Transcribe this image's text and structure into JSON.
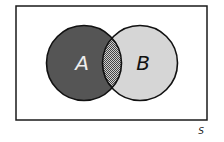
{
  "diagram": {
    "type": "venn",
    "universe": {
      "label": "S",
      "rect": {
        "x": 16,
        "y": 6,
        "width": 191,
        "height": 114
      },
      "fill": "#ffffff",
      "stroke": "#1a1a1a"
    },
    "sets": [
      {
        "label": "A",
        "cx": 84,
        "cy": 63,
        "r": 37.5,
        "fill": "#555555",
        "label_color": "#eeeeee"
      },
      {
        "label": "B",
        "cx": 140,
        "cy": 63,
        "r": 37.5,
        "fill": "#d6d6d6",
        "label_color": "#111111"
      }
    ],
    "intersection": {
      "label": "A ∩ B",
      "pattern": "checkerboard",
      "pattern_dark": "#444444",
      "pattern_light": "#cfcfcf"
    },
    "outline_color": "#111111"
  }
}
